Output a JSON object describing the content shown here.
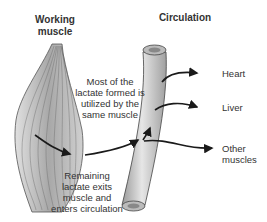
{
  "headings": {
    "working_muscle_line1": "Working",
    "working_muscle_line2": "muscle",
    "circulation": "Circulation"
  },
  "annotations": {
    "top_line1": "Most of the",
    "top_line2": "lactate formed is",
    "top_line3": "utilized by the",
    "top_line4": "same muscle",
    "bottom_line1": "Remaining",
    "bottom_line2": "lactate exits",
    "bottom_line3": "muscle and",
    "bottom_line4": "enters circulation"
  },
  "destinations": {
    "heart": "Heart",
    "liver": "Liver",
    "other_line1": "Other",
    "other_line2": "muscles"
  },
  "colors": {
    "arrow": "#1a1a1a",
    "muscle_fill": "#bdbdbd",
    "vessel_fill": "#c8c8c8",
    "text": "#333333"
  }
}
